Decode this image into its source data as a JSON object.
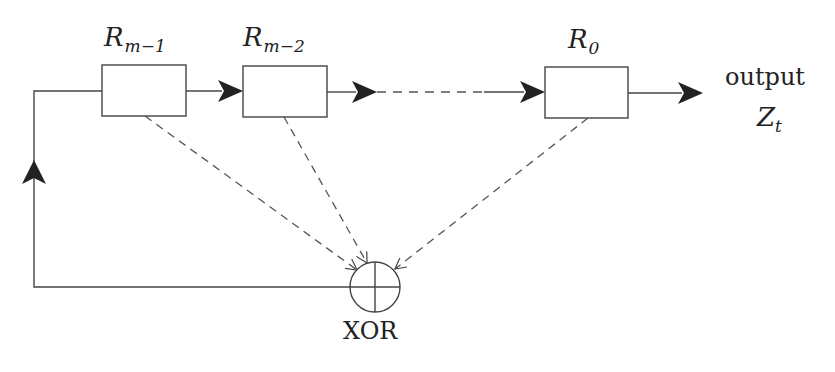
{
  "diagram": {
    "type": "linear feedback shift register",
    "colors": {
      "line": "#444444",
      "arrow": "#222222",
      "box_fill": "#ffffff",
      "background": "#ffffff"
    },
    "registers": [
      {
        "id": "r1",
        "base": "R",
        "subscript": "m−1"
      },
      {
        "id": "r2",
        "base": "R",
        "subscript": "m−2"
      },
      {
        "id": "r0",
        "base": "R",
        "subscript": "0"
      }
    ],
    "output": {
      "label": "output",
      "var_base": "Z",
      "var_subscript": "t"
    },
    "xor": {
      "label": "XOR"
    },
    "edges": [
      {
        "from": "R_m-1",
        "to": "R_m-2",
        "style": "solid",
        "arrow": true
      },
      {
        "from": "R_m-2",
        "to": "...",
        "style": "dashed",
        "arrow": false
      },
      {
        "from": "...",
        "to": "R_0",
        "style": "solid",
        "arrow": true
      },
      {
        "from": "R_0",
        "to": "output",
        "style": "solid",
        "arrow": true
      },
      {
        "from": "R_m-1",
        "to": "XOR",
        "style": "dashed",
        "arrow": "open"
      },
      {
        "from": "R_m-2",
        "to": "XOR",
        "style": "dashed",
        "arrow": "open"
      },
      {
        "from": "R_0",
        "to": "XOR",
        "style": "dashed",
        "arrow": "open"
      },
      {
        "from": "XOR",
        "to": "R_m-1",
        "style": "solid",
        "arrow": true,
        "route": "feedback loop left side"
      }
    ]
  }
}
